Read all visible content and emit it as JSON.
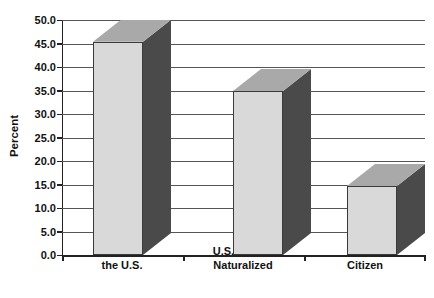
{
  "chart_data": {
    "type": "bar",
    "title": "",
    "subtitle": "",
    "xlabel": "",
    "ylabel": "Percent",
    "categories": [
      "Born in the U.S.",
      "U.S. Citizen Naturalized",
      "Not a Citizen"
    ],
    "category_lines": [
      [
        "Born in",
        "the U.S."
      ],
      [
        "U.S. Citizen",
        "Naturalized"
      ],
      [
        "Not a",
        "Citizen"
      ]
    ],
    "values": [
      45.4,
      34.9,
      14.7
    ],
    "ylim": [
      0.0,
      50.0
    ],
    "ytick_step": 5.0,
    "ytick_labels": [
      "50.0",
      "45.0",
      "40.0",
      "35.0",
      "30.0",
      "25.0",
      "20.0",
      "15.0",
      "10.0",
      "5.0",
      "0.0"
    ],
    "ytick_values": [
      50.0,
      45.0,
      40.0,
      35.0,
      30.0,
      25.0,
      20.0,
      15.0,
      10.0,
      5.0,
      0.0
    ],
    "grid": true,
    "legend": "none",
    "style": "3d-column",
    "colors": {
      "bar_front": "#d9d9d9",
      "bar_side": "#4a4a4a",
      "bar_top": "#a9a9a9",
      "bar_edge": "#3a3a3a",
      "grid": "#555555",
      "axis": "#222222",
      "text": "#111111",
      "background": "#ffffff"
    }
  }
}
